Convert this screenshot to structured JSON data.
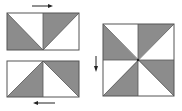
{
  "diagram": {
    "colors": {
      "shade": "#8c8c8c",
      "light": "#ffffff",
      "outline": "#555555",
      "arrow": "#222222"
    },
    "panels": [
      {
        "id": "top-strip",
        "label": "top strip",
        "arrow_direction": "right"
      },
      {
        "id": "bottom-strip",
        "label": "bottom strip",
        "arrow_direction": "left"
      },
      {
        "id": "pinwheel-block",
        "label": "pinwheel block",
        "arrow_direction": "down"
      }
    ]
  }
}
